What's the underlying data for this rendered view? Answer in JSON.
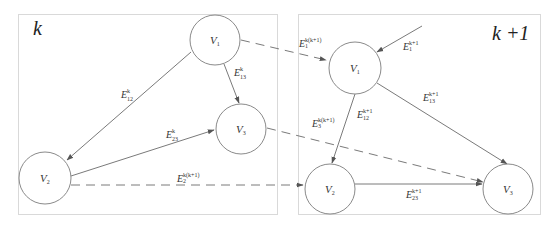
{
  "diagram": {
    "title": "",
    "panels": [
      {
        "id": "k",
        "label": "k",
        "nodes": [
          {
            "id": "V1",
            "base": "V",
            "sub": "1"
          },
          {
            "id": "V2",
            "base": "V",
            "sub": "2"
          },
          {
            "id": "V3",
            "base": "V",
            "sub": "3"
          }
        ],
        "edges": [
          {
            "from": "V1",
            "to": "V2",
            "base": "E",
            "sup": "k",
            "sub": "12"
          },
          {
            "from": "V1",
            "to": "V3",
            "base": "E",
            "sup": "k",
            "sub": "13"
          },
          {
            "from": "V2",
            "to": "V3",
            "base": "E",
            "sup": "k",
            "sub": "23"
          }
        ]
      },
      {
        "id": "k+1",
        "label": "k +1",
        "nodes": [
          {
            "id": "V1",
            "base": "V",
            "sub": "1"
          },
          {
            "id": "V2",
            "base": "V",
            "sub": "2"
          },
          {
            "id": "V3",
            "base": "V",
            "sub": "3"
          }
        ],
        "edges": [
          {
            "from": "external",
            "to": "V1",
            "base": "E",
            "sup": "k+1",
            "sub": "1"
          },
          {
            "from": "V1",
            "to": "V2",
            "base": "E",
            "sup": "k+1",
            "sub": "12"
          },
          {
            "from": "V1",
            "to": "V3",
            "base": "E",
            "sup": "k+1",
            "sub": "13"
          },
          {
            "from": "V2",
            "to": "V3",
            "base": "E",
            "sup": "k+1",
            "sub": "23"
          }
        ]
      }
    ],
    "inter_panel_edges": [
      {
        "from": "k.V1",
        "to": "k+1.V1",
        "style": "dashed",
        "base": "E",
        "sup": "k(k+1)",
        "sub": "1"
      },
      {
        "from": "k.V3",
        "to": "k+1.V3",
        "style": "dashed",
        "base": "E",
        "sup": "k(k+1)",
        "sub": "3"
      },
      {
        "from": "k.V2",
        "to": "k+1.V2",
        "style": "dashed",
        "base": "E",
        "sup": "k(k+1)",
        "sub": "2"
      }
    ]
  }
}
